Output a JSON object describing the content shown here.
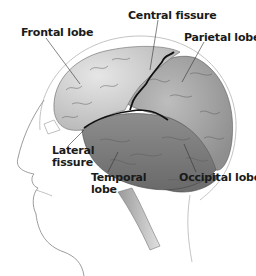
{
  "diagram": {
    "labels": [
      {
        "id": "frontal",
        "text": "Frontal lobe",
        "x": 21,
        "y": 27
      },
      {
        "id": "central",
        "text": "Central fissure",
        "x": 128,
        "y": 10
      },
      {
        "id": "parietal",
        "text": "Parietal lobe",
        "x": 184,
        "y": 32
      },
      {
        "id": "lateral",
        "text": "Lateral\nfissure",
        "x": 52,
        "y": 145
      },
      {
        "id": "temporal",
        "text": "Temporal\nlobe",
        "x": 91,
        "y": 172
      },
      {
        "id": "occipital",
        "text": "Occipital lobe",
        "x": 179,
        "y": 172
      }
    ],
    "colors": {
      "brain_light": "#d9d9d9",
      "brain_mid": "#a8a8a8",
      "brain_dark": "#6f6f6f",
      "fissure": "#111111",
      "outline": "#9a9a9a",
      "text": "#1a1a1a"
    }
  }
}
